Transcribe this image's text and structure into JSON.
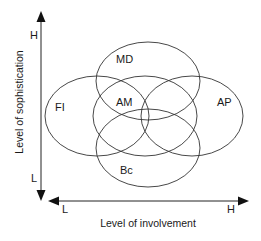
{
  "diagram": {
    "type": "venn-positioning-map",
    "axes": {
      "y": {
        "title": "Level of sophistication",
        "high_label": "H",
        "low_label": "L"
      },
      "x": {
        "title": "Level of involvement",
        "low_label": "L",
        "high_label": "H"
      }
    },
    "sets": [
      {
        "id": "md",
        "label": "MD",
        "cx": 148,
        "cy": 81,
        "rx": 52,
        "ry": 39
      },
      {
        "id": "fi",
        "label": "FI",
        "cx": 97,
        "cy": 116,
        "rx": 52,
        "ry": 40
      },
      {
        "id": "am",
        "label": "AM",
        "cx": 145,
        "cy": 116,
        "rx": 52,
        "ry": 40
      },
      {
        "id": "ap",
        "label": "AP",
        "cx": 192,
        "cy": 116,
        "rx": 51,
        "ry": 40
      },
      {
        "id": "bc",
        "label": "Bc",
        "cx": 148,
        "cy": 148,
        "rx": 52,
        "ry": 39
      }
    ],
    "colors": {
      "stroke": "#333333",
      "text": "#1a1a1a",
      "background": "#ffffff"
    }
  }
}
